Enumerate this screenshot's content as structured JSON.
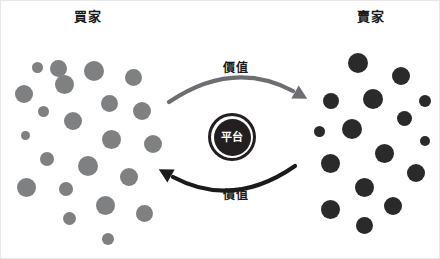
{
  "diagram": {
    "title_left": "買家",
    "title_right": "賣家",
    "platform_label": "平台",
    "flow_top_label": "價值",
    "flow_bottom_label": "價值",
    "colors": {
      "buyer_dot": "#7f8081",
      "seller_dot": "#2b2a2a",
      "platform_fill": "#231f20",
      "platform_text": "#ffffff",
      "arrow_top": "#6d6e71",
      "arrow_bottom": "#1b1b1b",
      "background": "#ffffff"
    },
    "buyer_dots": [
      {
        "cx": 57,
        "cy": 67,
        "r": 8.5
      },
      {
        "cx": 36,
        "cy": 66,
        "r": 5.5
      },
      {
        "cx": 93,
        "cy": 70,
        "r": 10
      },
      {
        "cx": 132,
        "cy": 76,
        "r": 8.5
      },
      {
        "cx": 63,
        "cy": 83,
        "r": 9.5
      },
      {
        "cx": 23,
        "cy": 93,
        "r": 9
      },
      {
        "cx": 108,
        "cy": 102,
        "r": 8.5
      },
      {
        "cx": 141,
        "cy": 110,
        "r": 9
      },
      {
        "cx": 42,
        "cy": 110,
        "r": 5.5
      },
      {
        "cx": 72,
        "cy": 120,
        "r": 9
      },
      {
        "cx": 110,
        "cy": 138,
        "r": 9.5
      },
      {
        "cx": 24,
        "cy": 134,
        "r": 4.5
      },
      {
        "cx": 152,
        "cy": 143,
        "r": 9
      },
      {
        "cx": 46,
        "cy": 158,
        "r": 7
      },
      {
        "cx": 87,
        "cy": 165,
        "r": 10
      },
      {
        "cx": 128,
        "cy": 176,
        "r": 9
      },
      {
        "cx": 25,
        "cy": 186,
        "r": 9.5
      },
      {
        "cx": 65,
        "cy": 188,
        "r": 7
      },
      {
        "cx": 104,
        "cy": 204,
        "r": 9.5
      },
      {
        "cx": 143,
        "cy": 212,
        "r": 8.5
      },
      {
        "cx": 68,
        "cy": 217,
        "r": 6.5
      },
      {
        "cx": 107,
        "cy": 238,
        "r": 6
      }
    ],
    "seller_dots": [
      {
        "cx": 357,
        "cy": 62,
        "r": 10
      },
      {
        "cx": 400,
        "cy": 75,
        "r": 9
      },
      {
        "cx": 330,
        "cy": 100,
        "r": 8
      },
      {
        "cx": 372,
        "cy": 98,
        "r": 10
      },
      {
        "cx": 424,
        "cy": 100,
        "r": 6
      },
      {
        "cx": 403,
        "cy": 117,
        "r": 7.5
      },
      {
        "cx": 318,
        "cy": 130,
        "r": 5.5
      },
      {
        "cx": 351,
        "cy": 128,
        "r": 10
      },
      {
        "cx": 424,
        "cy": 140,
        "r": 5
      },
      {
        "cx": 383,
        "cy": 152,
        "r": 9.5
      },
      {
        "cx": 329,
        "cy": 162,
        "r": 9.5
      },
      {
        "cx": 415,
        "cy": 172,
        "r": 9
      },
      {
        "cx": 363,
        "cy": 186,
        "r": 9.5
      },
      {
        "cx": 392,
        "cy": 205,
        "r": 9
      },
      {
        "cx": 329,
        "cy": 208,
        "r": 9.5
      },
      {
        "cx": 363,
        "cy": 224,
        "r": 8.5
      }
    ]
  }
}
